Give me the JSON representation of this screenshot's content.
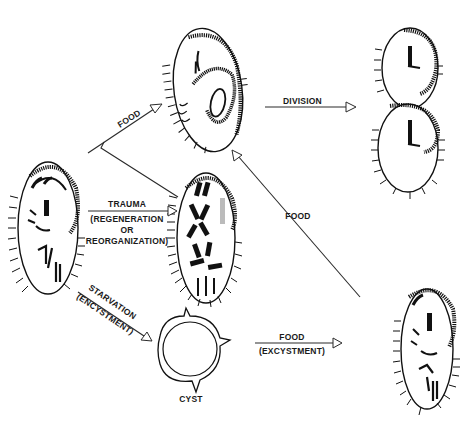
{
  "diagram": {
    "type": "life-cycle diagram",
    "nodes": [
      {
        "id": "start-cell",
        "label": ""
      },
      {
        "id": "fed-cell",
        "label": ""
      },
      {
        "id": "regenerating-cell",
        "label": ""
      },
      {
        "id": "dividing-cells",
        "label": ""
      },
      {
        "id": "cyst",
        "label": "CYST"
      },
      {
        "id": "excysted-cell",
        "label": ""
      }
    ],
    "edges": [
      {
        "from": "start-cell",
        "to": "fed-cell",
        "label": "FOOD"
      },
      {
        "from": "fed-cell",
        "to": "dividing-cells",
        "label": "DIVISION"
      },
      {
        "from": "start-cell",
        "to": "regenerating-cell",
        "label_lines": [
          "TRAUMA",
          "(REGENERATION",
          "OR",
          "REORGANIZATION)"
        ]
      },
      {
        "from": "start-cell",
        "to": "cyst",
        "label_lines": [
          "STARVATION",
          "(ENCYSTMENT)"
        ]
      },
      {
        "from": "cyst",
        "to": "excysted-cell",
        "label_lines": [
          "FOOD",
          "(EXCYSTMENT)"
        ]
      },
      {
        "from": "excysted-cell",
        "to": "fed-cell",
        "label": "FOOD"
      }
    ]
  },
  "labels": {
    "food_top": "FOOD",
    "division": "DIVISION",
    "trauma": "TRAUMA",
    "regeneration": "(REGENERATION",
    "or": "OR",
    "reorganization": "REORGANIZATION)",
    "starvation": "STARVATION",
    "encystment": "(ENCYSTMENT)",
    "cyst": "CYST",
    "food_excystment": "FOOD",
    "excystment": "(EXCYSTMENT)",
    "food_return": "FOOD"
  },
  "colors": {
    "ink": "#111111",
    "background": "#ffffff"
  }
}
